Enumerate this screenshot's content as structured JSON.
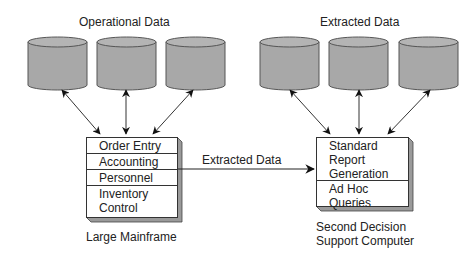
{
  "diagram": {
    "left_group": {
      "title": "Operational Data",
      "databases": [
        "db-1",
        "db-2",
        "db-3"
      ],
      "system": {
        "label": "Large Mainframe",
        "modules": [
          "Order Entry",
          "Accounting",
          "Personnel",
          "Inventory\nControl"
        ]
      }
    },
    "right_group": {
      "title": "Extracted Data",
      "databases": [
        "db-1",
        "db-2",
        "db-3"
      ],
      "system": {
        "label_line1": "Second Decision",
        "label_line2": "Support Computer",
        "modules": [
          "Standard\nReport\nGeneration",
          "Ad Hoc\nQueries"
        ]
      }
    },
    "connector": {
      "label": "Extracted Data",
      "direction": "left-to-right"
    },
    "colors": {
      "cylinder_fill": "#a8a8a8",
      "cylinder_stroke": "#555555",
      "box_shadow": "#9a9a9a",
      "line": "#222222"
    }
  }
}
